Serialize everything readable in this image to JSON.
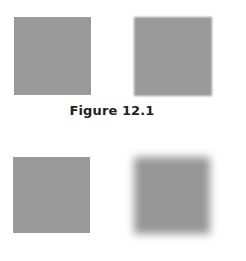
{
  "figure": {
    "caption": "Figure 12.1",
    "squares": [
      {
        "position": "top-left",
        "style": "sharp",
        "color": "#9a9a9a"
      },
      {
        "position": "top-right",
        "style": "slightly-blurred",
        "color": "#9a9a9a"
      },
      {
        "position": "bottom-left",
        "style": "sharp",
        "color": "#9a9a9a"
      },
      {
        "position": "bottom-right",
        "style": "heavily-blurred",
        "color": "#969696"
      }
    ]
  }
}
